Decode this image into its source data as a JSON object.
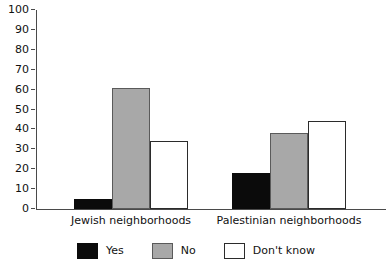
{
  "chart_data": {
    "type": "bar",
    "title": "",
    "subtitle": "",
    "xlabel": "",
    "ylabel": "",
    "ylim": [
      0,
      100
    ],
    "yticks": [
      0,
      10,
      20,
      30,
      40,
      50,
      60,
      70,
      80,
      90,
      100
    ],
    "ytick_labels": [
      "0",
      "10",
      "20",
      "30",
      "40",
      "50",
      "60",
      "70",
      "80",
      "90",
      "100"
    ],
    "grid": false,
    "legend_position": "bottom",
    "categories": [
      "Jewish neighborhoods",
      "Palestinian neighborhoods"
    ],
    "series": [
      {
        "name": "Yes",
        "color": "#0b0b0b",
        "values": [
          5,
          18
        ]
      },
      {
        "name": "No",
        "color": "#a8a8a8",
        "values": [
          61,
          38
        ]
      },
      {
        "name": "Don't know",
        "color": "#ffffff",
        "values": [
          34,
          44
        ]
      }
    ]
  },
  "legend": {
    "items": [
      {
        "label": "Yes",
        "swatch": "black-square-swatch"
      },
      {
        "label": "No",
        "swatch": "gray-square-swatch"
      },
      {
        "label": "Don't know",
        "swatch": "white-square-swatch"
      }
    ]
  },
  "axis": {
    "y_tick_0": "0",
    "y_tick_1": "10",
    "y_tick_2": "20",
    "y_tick_3": "30",
    "y_tick_4": "40",
    "y_tick_5": "50",
    "y_tick_6": "60",
    "y_tick_7": "70",
    "y_tick_8": "80",
    "y_tick_9": "90",
    "y_tick_10": "100"
  },
  "groups": {
    "group_0_label": "Jewish neighborhoods",
    "group_1_label": "Palestinian neighborhoods"
  }
}
